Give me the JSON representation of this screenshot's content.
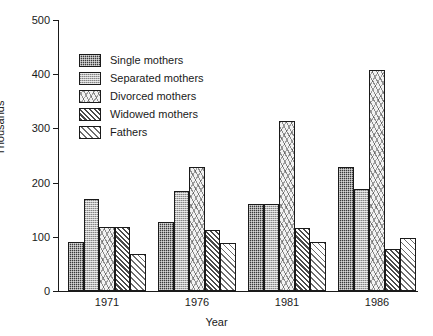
{
  "chart_data": {
    "type": "bar",
    "title": "",
    "subtitle": "",
    "xlabel": "Year",
    "ylabel": "Thousands",
    "categories": [
      "1971",
      "1976",
      "1981",
      "1986"
    ],
    "ylim": [
      0,
      500
    ],
    "yticks": [
      0,
      100,
      200,
      300,
      400,
      500
    ],
    "ytick_labels": [
      "0",
      "100",
      "200",
      "300",
      "400",
      "500"
    ],
    "grid": false,
    "legend_position": "upper-left-inside",
    "series": [
      {
        "name": "Single mothers",
        "pattern": "dense-checker-dark",
        "values": [
          90,
          128,
          161,
          228
        ]
      },
      {
        "name": "Separated mothers",
        "pattern": "light-checker-grey",
        "values": [
          170,
          184,
          161,
          188
        ]
      },
      {
        "name": "Divorced mothers",
        "pattern": "speckled-light",
        "values": [
          118,
          229,
          313,
          407
        ]
      },
      {
        "name": "Widowed mothers",
        "pattern": "dense-diagonal-hatch",
        "values": [
          118,
          113,
          116,
          77
        ]
      },
      {
        "name": "Fathers",
        "pattern": "sparse-diagonal-hatch",
        "values": [
          68,
          88,
          91,
          97
        ]
      }
    ]
  },
  "legend": {
    "items": [
      {
        "label": "Single mothers"
      },
      {
        "label": "Separated mothers"
      },
      {
        "label": "Divorced mothers"
      },
      {
        "label": "Widowed mothers"
      },
      {
        "label": "Fathers"
      }
    ]
  },
  "colors": {
    "axis": "#1a1a1a",
    "background": "#ffffff",
    "single": "#3a3a3a",
    "separated": "#b9b9b9",
    "divorced": "#f2f2f2",
    "widowed": "#4a4a4a",
    "fathers": "#6e6e6e"
  }
}
